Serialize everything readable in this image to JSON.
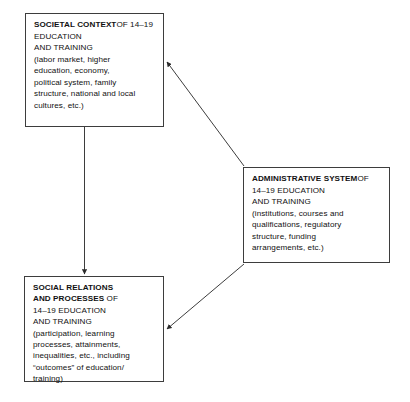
{
  "diagram": {
    "type": "relationship-model",
    "background_color": "#ffffff",
    "line_color": "#3d3d3d",
    "text_color": "#111111",
    "nodes": [
      {
        "id": "societal-context",
        "heading": "SOCIETAL CONTEXT",
        "subheading": "OF 14–19 EDUCATION\nAND TRAINING",
        "detail": "(labor market, higher\neducation, economy,\npolitical system, family\nstructure, national and local\ncultures, etc.)"
      },
      {
        "id": "administrative-system",
        "heading": "ADMINISTRATIVE SYSTEM",
        "subheading": "OF 14–19 EDUCATION\nAND TRAINING",
        "detail": "(institutions, courses and\nqualifications, regulatory\nstructure, funding\narrangements, etc.)"
      },
      {
        "id": "social-relations",
        "heading": "SOCIAL RELATIONS\nAND PROCESSES",
        "subheading": " OF\n14–19 EDUCATION\nAND TRAINING",
        "detail": "(participation, learning\nprocesses, attainments,\ninequalities, etc., including\n“outcomes” of education/\ntraining)"
      }
    ],
    "connectors": [
      {
        "id": "societal-to-social",
        "from": "societal-context",
        "to": "social-relations",
        "direction": "down",
        "arrowheads": "single"
      },
      {
        "id": "administrative-to-societal",
        "from": "administrative-system",
        "to": "societal-context",
        "direction": "up-left",
        "arrowheads": "single"
      },
      {
        "id": "administrative-to-social",
        "from": "administrative-system",
        "to": "social-relations",
        "direction": "down-left",
        "arrowheads": "single"
      }
    ]
  }
}
